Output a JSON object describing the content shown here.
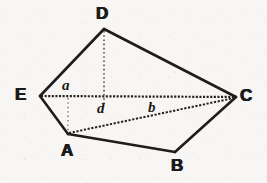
{
  "figure": {
    "kind": "geometry-diagram",
    "background_color": "#f7f6f4",
    "stroke_color": "#1f1d1b",
    "canvas": {
      "width": 267,
      "height": 183
    }
  },
  "vertices": [
    {
      "id": "D",
      "label": "D",
      "x": 104,
      "y": 29,
      "label_x": 96,
      "label_y": 5
    },
    {
      "id": "E",
      "label": "E",
      "x": 40,
      "y": 96,
      "label_x": 15,
      "label_y": 86
    },
    {
      "id": "C",
      "label": "C",
      "x": 236,
      "y": 97,
      "label_x": 240,
      "label_y": 87
    },
    {
      "id": "A",
      "label": "A",
      "x": 68,
      "y": 134,
      "label_x": 61,
      "label_y": 142
    },
    {
      "id": "B",
      "label": "B",
      "x": 175,
      "y": 152,
      "label_x": 171,
      "label_y": 157
    }
  ],
  "edges": [
    {
      "id": "DE",
      "from": "D",
      "to": "E",
      "style": "solid"
    },
    {
      "id": "DC",
      "from": "D",
      "to": "C",
      "style": "solid"
    },
    {
      "id": "EA",
      "from": "E",
      "to": "A",
      "style": "solid"
    },
    {
      "id": "AB",
      "from": "A",
      "to": "B",
      "style": "solid"
    },
    {
      "id": "BC",
      "from": "B",
      "to": "C",
      "style": "solid"
    }
  ],
  "diagonals": [
    {
      "id": "EC",
      "from": "E",
      "to": "C",
      "style": "dotted"
    },
    {
      "id": "AC",
      "from": "A",
      "to": "C",
      "style": "dotted"
    },
    {
      "id": "D-foot",
      "from": "D",
      "to": "foot-on-EC",
      "style": "dotted",
      "x": 104,
      "y1": 31,
      "y2": 104
    },
    {
      "id": "A-foot",
      "from": "foot-on-EC",
      "to": "A",
      "style": "dotted",
      "x": 68,
      "y1": 98,
      "y2": 132
    }
  ],
  "segment_labels": [
    {
      "id": "a",
      "label": "a",
      "x": 62,
      "y": 78
    },
    {
      "id": "d",
      "label": "d",
      "x": 97,
      "y": 101
    },
    {
      "id": "b",
      "label": "b",
      "x": 148,
      "y": 100
    }
  ]
}
